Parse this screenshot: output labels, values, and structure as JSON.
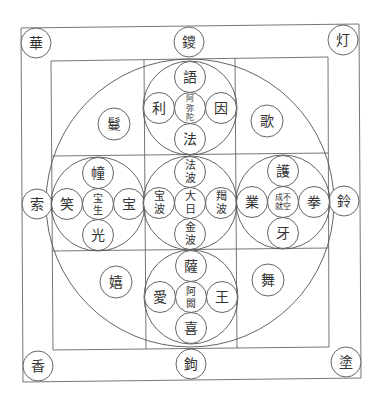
{
  "colors": {
    "line": "#666666",
    "circle": "#555555",
    "text": "#333333",
    "background": "#ffffff"
  },
  "outer_corners": [
    {
      "name": "top-left",
      "label": "華",
      "x": 36,
      "y": 43
    },
    {
      "name": "top-right",
      "label": "灯",
      "x": 343,
      "y": 40
    },
    {
      "name": "bottom-left",
      "label": "香",
      "x": 38,
      "y": 366
    },
    {
      "name": "bottom-right",
      "label": "塗",
      "x": 346,
      "y": 362
    }
  ],
  "gates": [
    {
      "name": "top",
      "label": "鑁",
      "x": 189,
      "y": 42
    },
    {
      "name": "left",
      "label": "索",
      "x": 37,
      "y": 204
    },
    {
      "name": "right",
      "label": "鈴",
      "x": 344,
      "y": 201
    },
    {
      "name": "bottom",
      "label": "鉤",
      "x": 191,
      "y": 364
    }
  ],
  "inner_offerings": [
    {
      "name": "top-left",
      "label": "鬘",
      "x": 114,
      "y": 124
    },
    {
      "name": "top-right",
      "label": "歌",
      "x": 267,
      "y": 121
    },
    {
      "name": "bottom-left",
      "label": "嬉",
      "x": 116,
      "y": 282
    },
    {
      "name": "bottom-right",
      "label": "舞",
      "x": 268,
      "y": 280
    }
  ],
  "assemblies": [
    {
      "name": "amitabha-west",
      "cx": 190,
      "cy": 108,
      "center": {
        "lines": [
          "阿",
          "弥",
          "陀"
        ],
        "size": 8
      },
      "top": "語",
      "left": "利",
      "right": "因",
      "bottom": "法"
    },
    {
      "name": "ratnasambhava-south",
      "cx": 98,
      "cy": 204,
      "center": {
        "lines": [
          "宝",
          "生"
        ],
        "size": 10
      },
      "top": "幢",
      "left": "笑",
      "right": "宝",
      "bottom": "光"
    },
    {
      "name": "vairocana-center",
      "cx": 190,
      "cy": 203,
      "center": {
        "lines": [
          "大",
          "日"
        ],
        "size": 11
      },
      "top": "法波",
      "left": "宝波",
      "right": "羯波",
      "bottom": "金波"
    },
    {
      "name": "amoghasiddhi-north",
      "cx": 283,
      "cy": 202,
      "center": {
        "lines": [
          "成不",
          "就空"
        ],
        "size": 8
      },
      "top": "護",
      "left": "業",
      "right": "拳",
      "bottom": "牙"
    },
    {
      "name": "akshobhya-east",
      "cx": 191,
      "cy": 297,
      "center": {
        "lines": [
          "阿",
          "閦"
        ],
        "size": 10
      },
      "top": "薩",
      "left": "愛",
      "right": "王",
      "bottom": "喜"
    }
  ]
}
